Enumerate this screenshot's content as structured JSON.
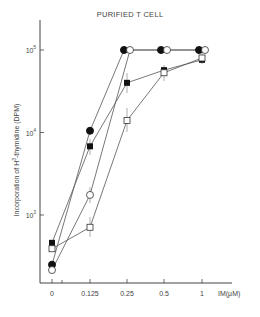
{
  "chart_data": {
    "type": "line",
    "title": "PURIFIED T CELL",
    "xlabel": "IM(μM)",
    "ylabel": "Incorporation of H³-thymidine (DPM)",
    "yscale": "log",
    "ylim": [
      100,
      200000
    ],
    "categories": [
      "0",
      "0.125",
      "0.25",
      "0.5",
      "1"
    ],
    "y_ticks": [
      "10³",
      "10⁴",
      "10⁵"
    ],
    "series": [
      {
        "name": "filled circle",
        "marker": "filled-circle",
        "values": [
          250,
          10500,
          100000,
          100000,
          100000
        ]
      },
      {
        "name": "open circle",
        "marker": "open-circle",
        "values": [
          215,
          1750,
          100000,
          100000,
          100000
        ]
      },
      {
        "name": "filled square",
        "marker": "filled-square",
        "values": [
          460,
          6800,
          40000,
          57000,
          76000
        ]
      },
      {
        "name": "open square",
        "marker": "open-square",
        "values": [
          390,
          710,
          14000,
          53000,
          80000
        ]
      }
    ],
    "grid": false,
    "legend": "none"
  },
  "labels": {
    "title": "PURIFIED T CELL",
    "xlabel": "IM(μM)",
    "ylabel_main": "Incorporation of H",
    "ylabel_sup": "3",
    "ylabel_rest": "-thymidine",
    "ylabel_unit": "(DPM)",
    "xticks": [
      "0",
      "0.125",
      "0.25",
      "0.5",
      "1"
    ],
    "ytick_base": "10",
    "ytick_exps": [
      "3",
      "4",
      "5"
    ]
  }
}
